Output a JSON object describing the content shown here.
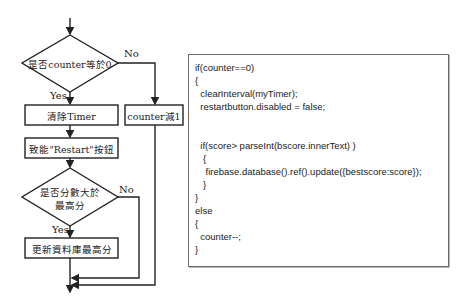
{
  "flowchart": {
    "decision1": "是否counter等於0",
    "decision1_yes": "Yes",
    "decision1_no": "No",
    "process_clear_timer": "清除Timer",
    "process_counter_decrement": "counter減1",
    "process_enable_restart": "致能\"Restart\"按鈕",
    "decision2_line1": "是否分數大於",
    "decision2_line2": "最高分",
    "decision2_yes": "Yes",
    "decision2_no": "No",
    "process_update_db": "更新資料庫最高分"
  },
  "code": {
    "lines": [
      "if(counter==0)",
      "{",
      "  clearInterval(myTimer);",
      "  restartbutton.disabled = false;",
      "",
      "",
      "  if(score> parseInt(bscore.innerText) )",
      "   {",
      "    firebase.database().ref().update({bestscore:score});",
      "   }",
      "}",
      "else",
      "{",
      "  counter--;",
      "}"
    ]
  },
  "colors": {
    "stroke": "#222222",
    "code_border": "#6a6a6a"
  }
}
